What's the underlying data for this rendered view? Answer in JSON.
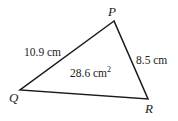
{
  "diagram": {
    "type": "triangle",
    "stroke_color": "#1a1a1a",
    "vertices": {
      "P": {
        "label": "P",
        "x": 114,
        "y": 21
      },
      "Q": {
        "label": "Q",
        "x": 20,
        "y": 90
      },
      "R": {
        "label": "R",
        "x": 148,
        "y": 99
      }
    },
    "sides": {
      "QP": {
        "label": "10.9 cm"
      },
      "PR": {
        "label": "8.5 cm"
      }
    },
    "area": {
      "label": "28.6 cm",
      "superscript": "2"
    }
  }
}
